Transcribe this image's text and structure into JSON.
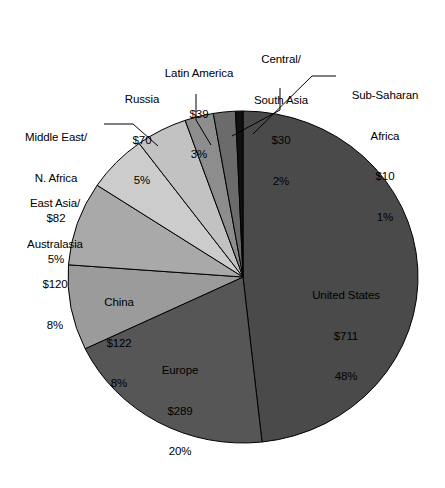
{
  "chart_data": {
    "type": "pie",
    "title": "",
    "subtitle": "",
    "xlabel": "",
    "ylabel": "",
    "legend_position": "none",
    "grid": false,
    "value_prefix": "$",
    "total_value": 1473,
    "start_angle_deg": 0,
    "direction": "clockwise",
    "categories": [
      "United States",
      "Europe",
      "China",
      "East Asia/ Australasia",
      "Middle East/ N. Africa",
      "Russia",
      "Latin America",
      "Central/ South Asia",
      "Sub-Saharan Africa"
    ],
    "values": [
      711,
      289,
      122,
      120,
      82,
      70,
      39,
      30,
      10
    ],
    "percents": [
      48,
      20,
      8,
      8,
      5,
      5,
      3,
      2,
      1
    ],
    "colors": [
      "#4a4a4a",
      "#565656",
      "#9b9b9b",
      "#a9a9a9",
      "#cccccc",
      "#c2c2c2",
      "#8d8d8d",
      "#6b6b6b",
      "#111111"
    ],
    "slices": [
      {
        "name": "united-states",
        "label_line1": "United States",
        "label_line2": "$711",
        "label_line3": "48%",
        "value": 711,
        "percent": 48,
        "color": "#4a4a4a",
        "placement": "inside"
      },
      {
        "name": "europe",
        "label_line1": "Europe",
        "label_line2": "$289",
        "label_line3": "20%",
        "value": 289,
        "percent": 20,
        "color": "#565656",
        "placement": "inside"
      },
      {
        "name": "china",
        "label_line1": "China",
        "label_line2": "$122",
        "label_line3": "8%",
        "value": 122,
        "percent": 8,
        "color": "#9b9b9b",
        "placement": "inside"
      },
      {
        "name": "east-asia-australasia",
        "label_line1": "East Asia/",
        "label_line2": "Australasia",
        "label_line3": "$120",
        "label_line4": "8%",
        "value": 120,
        "percent": 8,
        "color": "#a9a9a9",
        "placement": "outside"
      },
      {
        "name": "middle-east-n-africa",
        "label_line1": "Middle East/",
        "label_line2": "N. Africa",
        "label_line3": "$82",
        "label_line4": "5%",
        "value": 82,
        "percent": 5,
        "color": "#cccccc",
        "placement": "outside-leader"
      },
      {
        "name": "russia",
        "label_line1": "Russia",
        "label_line2": "$70",
        "label_line3": "5%",
        "value": 70,
        "percent": 5,
        "color": "#c2c2c2",
        "placement": "outside"
      },
      {
        "name": "latin-america",
        "label_line1": "Latin America",
        "label_line2": "$39",
        "label_line3": "3%",
        "value": 39,
        "percent": 3,
        "color": "#8d8d8d",
        "placement": "outside-leader"
      },
      {
        "name": "central-south-asia",
        "label_line1": "Central/",
        "label_line2": "South Asia",
        "label_line3": "$30",
        "label_line4": "2%",
        "value": 30,
        "percent": 2,
        "color": "#6b6b6b",
        "placement": "outside-leader"
      },
      {
        "name": "sub-saharan-africa",
        "label_line1": "Sub-Saharan",
        "label_line2": "Africa",
        "label_line3": "$10",
        "label_line4": "1%",
        "value": 10,
        "percent": 1,
        "color": "#111111",
        "placement": "outside-leader"
      }
    ]
  }
}
